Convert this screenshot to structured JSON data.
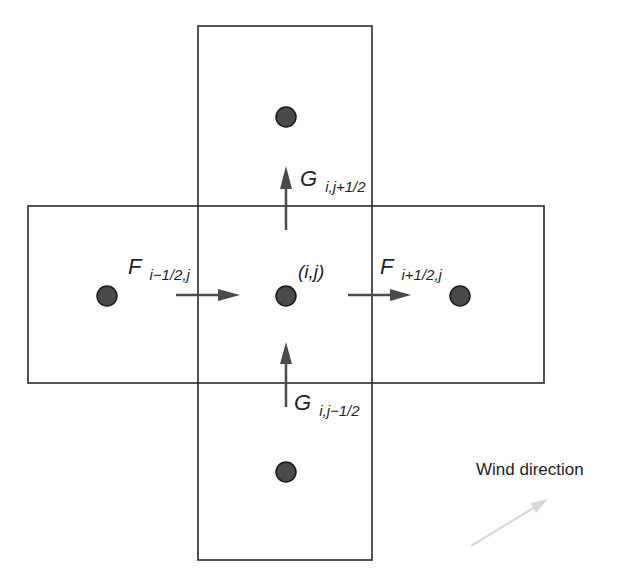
{
  "diagram": {
    "colors": {
      "stroke": "#2a2a2a",
      "dot_fill": "#4a4a4a",
      "arrow": "#4a4a4a",
      "wind_arrow": "#d8d8d8",
      "background": "#ffffff"
    },
    "cells": [
      {
        "id": "center",
        "label": "(i,j)",
        "cx": 286,
        "cy": 296
      },
      {
        "id": "north",
        "cx": 286,
        "cy": 117
      },
      {
        "id": "south",
        "cx": 286,
        "cy": 472
      },
      {
        "id": "west",
        "cx": 107,
        "cy": 296
      },
      {
        "id": "east",
        "cx": 460,
        "cy": 296
      }
    ],
    "fluxes": {
      "F_west": {
        "symbol": "F",
        "subscript": "i−1/2,j"
      },
      "F_east": {
        "symbol": "F",
        "subscript": "i+1/2,j"
      },
      "G_north": {
        "symbol": "G",
        "subscript": "i,j+1/2"
      },
      "G_south": {
        "symbol": "G",
        "subscript": "i,j−1/2"
      }
    },
    "center_label": "(i,j)",
    "wind": {
      "label": "Wind direction"
    }
  }
}
